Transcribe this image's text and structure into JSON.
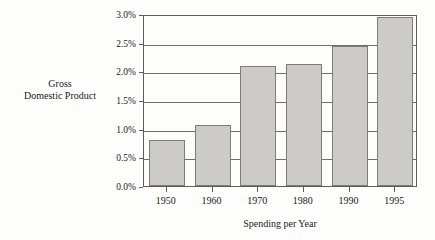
{
  "chart_data": {
    "type": "bar",
    "title": "",
    "subtitle": "",
    "xlabel": "Spending per Year",
    "ylabel": "Gross Domestic Product",
    "ylabel_lines": [
      "Gross",
      "Domestic Product"
    ],
    "categories": [
      "1950",
      "1960",
      "1970",
      "1980",
      "1990",
      "1995"
    ],
    "values": [
      0.8,
      1.06,
      2.09,
      2.12,
      2.44,
      2.94
    ],
    "value_labels": [
      "0.8%",
      "1.06%",
      "2.09%",
      "2.12%",
      "2.44%",
      "2.94%"
    ],
    "ylim": [
      0,
      3.0
    ],
    "ytick_values": [
      0.0,
      0.5,
      1.0,
      1.5,
      2.0,
      2.5,
      3.0
    ],
    "ytick_labels": [
      "0.0%",
      "0.5%",
      "1.0%",
      "1.5%",
      "2.0%",
      "2.5%",
      "3.0%"
    ],
    "grid": true,
    "grid_axis": "y",
    "legend": false,
    "legend_position": "none",
    "series": [
      {
        "name": "Gross Domestic Product",
        "values": [
          0.8,
          1.06,
          2.09,
          2.12,
          2.44,
          2.94
        ]
      }
    ]
  },
  "colors": {
    "bar_fill": "#cccbc9",
    "bar_border": "#7c7c7c",
    "axis": "#5d5d5d",
    "gridline": "#6e6e6e",
    "background": "#fdfdfc",
    "text": "#1a1a1a"
  }
}
